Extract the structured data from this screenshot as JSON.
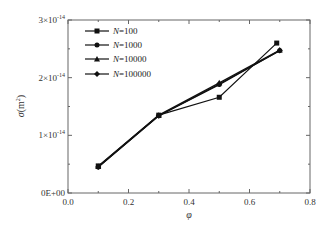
{
  "chart_data": {
    "type": "line",
    "title": "",
    "xlabel": "φ",
    "ylabel": "σ(m²)",
    "xlim": [
      0.0,
      0.8
    ],
    "ylim": [
      0,
      3e-14
    ],
    "grid": false,
    "legend_position": "upper-left",
    "x_ticks": [
      "0.0",
      "0.2",
      "0.4",
      "0.6",
      "0.8"
    ],
    "y_ticks": [
      "0E+00",
      "1×10⁻¹⁴",
      "2×10⁻¹⁴",
      "3×10⁻¹⁴"
    ],
    "series": [
      {
        "name": "N=100",
        "marker": "square",
        "x": [
          0.1,
          0.3,
          0.5,
          0.69
        ],
        "y": [
          4.7e-15,
          1.35e-14,
          1.66e-14,
          2.6e-14
        ]
      },
      {
        "name": "N=1000",
        "marker": "circle",
        "x": [
          0.1,
          0.3,
          0.5,
          0.7
        ],
        "y": [
          4.5e-15,
          1.34e-14,
          1.88e-14,
          2.47e-14
        ]
      },
      {
        "name": "N=10000",
        "marker": "triangle",
        "x": [
          0.1,
          0.3,
          0.5,
          0.7
        ],
        "y": [
          4.6e-15,
          1.35e-14,
          1.91e-14,
          2.48e-14
        ]
      },
      {
        "name": "N=100000",
        "marker": "diamond",
        "x": [
          0.1,
          0.3,
          0.5,
          0.7
        ],
        "y": [
          4.5e-15,
          1.34e-14,
          1.89e-14,
          2.47e-14
        ]
      }
    ]
  },
  "legend": {
    "items": [
      {
        "prefix": "N",
        "suffix": "=100"
      },
      {
        "prefix": "N",
        "suffix": "=1000"
      },
      {
        "prefix": "N",
        "suffix": "=10000"
      },
      {
        "prefix": "N",
        "suffix": "=100000"
      }
    ]
  },
  "axes": {
    "x_title": "φ",
    "y_title_sym": "σ",
    "y_title_unit": "(m",
    "y_title_exp": "2",
    "y_title_close": ")",
    "x_ticks": [
      "0.0",
      "0.2",
      "0.4",
      "0.6",
      "0.8"
    ],
    "y_ticks": [
      {
        "mant": "0E+00",
        "exp": ""
      },
      {
        "mant": "1×10",
        "exp": "-14"
      },
      {
        "mant": "2×10",
        "exp": "-14"
      },
      {
        "mant": "3×10",
        "exp": "-14"
      }
    ]
  },
  "colors": {
    "line": "#111111",
    "axis": "#555555",
    "background": "#ffffff"
  }
}
